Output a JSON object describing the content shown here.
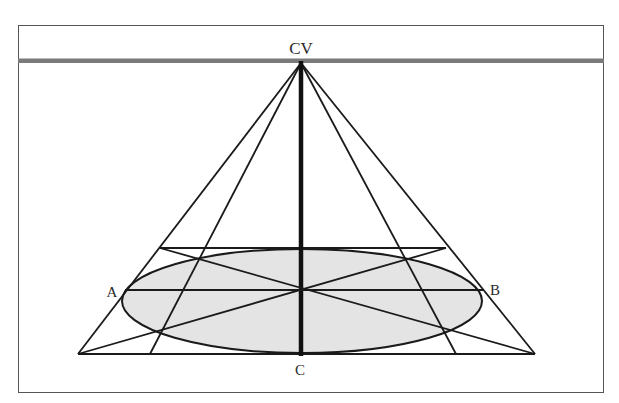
{
  "diagram": {
    "labels": {
      "center_of_vision": "CV",
      "point_a": "A",
      "point_b": "B",
      "point_c": "C"
    },
    "colors": {
      "frame": "#555555",
      "horizon": "#7a7a7a",
      "lines": "#1a1a1a",
      "ellipse_fill": "#e4e4e4",
      "background": "#ffffff"
    }
  }
}
